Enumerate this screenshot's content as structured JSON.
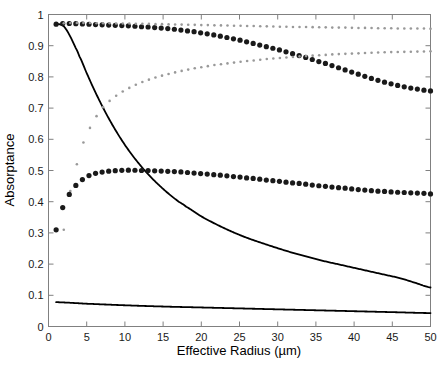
{
  "chart_data": {
    "type": "line",
    "title": "",
    "xlabel": "Effective Radius (µm)",
    "ylabel": "Absorptance",
    "xlim": [
      0,
      50
    ],
    "ylim": [
      0,
      1
    ],
    "xticks": [
      0,
      5,
      10,
      15,
      20,
      25,
      30,
      35,
      40,
      45,
      50
    ],
    "xticklabels": [
      "0",
      "5",
      "10",
      "15",
      "20",
      "25",
      "30",
      "35",
      "40",
      "45",
      "50"
    ],
    "yticks": [
      0,
      0.1,
      0.2,
      0.3,
      0.4,
      0.5,
      0.6,
      0.7,
      0.8,
      0.9,
      1
    ],
    "yticklabels": [
      "0",
      "0.1",
      "0.2",
      "0.3",
      "0.4",
      "0.5",
      "0.6",
      "0.7",
      "0.8",
      "0.9",
      "1"
    ],
    "grid": false,
    "legend": "none",
    "background": "#ffffff",
    "axis_color": "#808080",
    "series": [
      {
        "name": "solid-upper-decreasing",
        "style": "solid",
        "color": "#000000",
        "linewidth": 1.8,
        "x": [
          1,
          1.5,
          2,
          2.5,
          3,
          3.5,
          4,
          5,
          6,
          7,
          8,
          9,
          10,
          11,
          12,
          13,
          14,
          15,
          16,
          17,
          18,
          20,
          22,
          24,
          26,
          28,
          30,
          32,
          34,
          36,
          38,
          40,
          42,
          44,
          46,
          48,
          50
        ],
        "y": [
          0.97,
          0.968,
          0.962,
          0.945,
          0.922,
          0.896,
          0.868,
          0.812,
          0.758,
          0.708,
          0.662,
          0.62,
          0.582,
          0.548,
          0.517,
          0.489,
          0.464,
          0.441,
          0.42,
          0.401,
          0.384,
          0.353,
          0.327,
          0.304,
          0.284,
          0.267,
          0.251,
          0.236,
          0.223,
          0.21,
          0.199,
          0.188,
          0.177,
          0.166,
          0.155,
          0.14,
          0.125
        ]
      },
      {
        "name": "solid-lower-flat",
        "style": "solid",
        "color": "#000000",
        "linewidth": 1.8,
        "x": [
          1,
          5,
          10,
          15,
          20,
          25,
          30,
          35,
          40,
          45,
          50
        ],
        "y": [
          0.078,
          0.073,
          0.068,
          0.064,
          0.061,
          0.058,
          0.055,
          0.052,
          0.049,
          0.046,
          0.043
        ]
      },
      {
        "name": "dotted-bold-top-decreasing",
        "style": "dotted",
        "weight": "bold",
        "color": "#1a1a1a",
        "dotsize": 2.6,
        "x": [
          1,
          2,
          3,
          4,
          5,
          6,
          7,
          8,
          9,
          10,
          11,
          12,
          13,
          14,
          15,
          16,
          17,
          18,
          19,
          20,
          21,
          22,
          23,
          24,
          25,
          26,
          27,
          28,
          29,
          30,
          31,
          32,
          33,
          34,
          35,
          36,
          37,
          38,
          39,
          40,
          41,
          42,
          43,
          44,
          45,
          46,
          47,
          48,
          49,
          50
        ],
        "y": [
          0.969,
          0.971,
          0.971,
          0.97,
          0.969,
          0.968,
          0.967,
          0.966,
          0.965,
          0.964,
          0.963,
          0.961,
          0.96,
          0.958,
          0.956,
          0.954,
          0.951,
          0.948,
          0.945,
          0.941,
          0.937,
          0.933,
          0.928,
          0.923,
          0.918,
          0.912,
          0.906,
          0.9,
          0.894,
          0.888,
          0.881,
          0.874,
          0.867,
          0.86,
          0.852,
          0.845,
          0.837,
          0.829,
          0.821,
          0.813,
          0.805,
          0.797,
          0.79,
          0.783,
          0.777,
          0.771,
          0.766,
          0.762,
          0.758,
          0.755
        ]
      },
      {
        "name": "dotted-light-top-flat",
        "style": "dotted",
        "weight": "light",
        "color": "#999999",
        "dotsize": 1.3,
        "x": [
          2,
          3,
          4,
          5,
          6,
          7,
          8,
          9,
          10,
          11,
          12,
          13,
          14,
          15,
          16,
          17,
          18,
          19,
          20,
          21,
          22,
          23,
          24,
          25,
          26,
          27,
          28,
          29,
          30,
          31,
          32,
          33,
          34,
          35,
          36,
          37,
          38,
          39,
          40,
          41,
          42,
          43,
          44,
          45,
          46,
          47,
          48,
          49,
          50
        ],
        "y": [
          0.972,
          0.973,
          0.973,
          0.973,
          0.972,
          0.972,
          0.972,
          0.971,
          0.971,
          0.971,
          0.97,
          0.97,
          0.969,
          0.969,
          0.968,
          0.968,
          0.967,
          0.967,
          0.966,
          0.966,
          0.965,
          0.965,
          0.964,
          0.964,
          0.963,
          0.963,
          0.962,
          0.962,
          0.961,
          0.961,
          0.96,
          0.96,
          0.96,
          0.959,
          0.959,
          0.958,
          0.958,
          0.958,
          0.957,
          0.957,
          0.957,
          0.956,
          0.956,
          0.956,
          0.955,
          0.955,
          0.955,
          0.955,
          0.954
        ]
      },
      {
        "name": "dotted-light-rising",
        "style": "dotted",
        "weight": "light",
        "color": "#999999",
        "dotsize": 1.3,
        "x": [
          2,
          2.5,
          3,
          3.5,
          4,
          4.5,
          5,
          5.5,
          6,
          6.5,
          7,
          8,
          9,
          10,
          11,
          12,
          13,
          14,
          15,
          16,
          17,
          18,
          19,
          20,
          21,
          22,
          23,
          24,
          25,
          26,
          27,
          28,
          29,
          30,
          31,
          32,
          33,
          34,
          35,
          36,
          37,
          38,
          39,
          40,
          42,
          44,
          46,
          48,
          50
        ],
        "y": [
          0.31,
          0.39,
          0.45,
          0.5,
          0.545,
          0.585,
          0.615,
          0.64,
          0.663,
          0.682,
          0.7,
          0.723,
          0.742,
          0.757,
          0.77,
          0.781,
          0.79,
          0.798,
          0.805,
          0.811,
          0.817,
          0.822,
          0.827,
          0.831,
          0.835,
          0.839,
          0.842,
          0.845,
          0.848,
          0.851,
          0.853,
          0.856,
          0.858,
          0.86,
          0.862,
          0.864,
          0.866,
          0.867,
          0.869,
          0.87,
          0.872,
          0.873,
          0.874,
          0.875,
          0.877,
          0.879,
          0.88,
          0.881,
          0.882
        ]
      },
      {
        "name": "dotted-bold-middle-peaked",
        "style": "dotted",
        "weight": "bold",
        "color": "#1a1a1a",
        "dotsize": 2.6,
        "x": [
          1,
          1.5,
          2,
          2.5,
          3,
          3.5,
          4,
          4.5,
          5,
          5.5,
          6,
          6.5,
          7,
          7.5,
          8,
          9,
          10,
          11,
          12,
          13,
          14,
          15,
          16,
          17,
          18,
          19,
          20,
          21,
          22,
          23,
          24,
          25,
          26,
          27,
          28,
          29,
          30,
          31,
          32,
          33,
          34,
          35,
          36,
          37,
          38,
          39,
          40,
          41,
          42,
          43,
          44,
          45,
          46,
          47,
          48,
          49,
          50
        ],
        "y": [
          0.31,
          0.355,
          0.39,
          0.414,
          0.434,
          0.45,
          0.462,
          0.472,
          0.48,
          0.486,
          0.49,
          0.493,
          0.495,
          0.497,
          0.498,
          0.5,
          0.501,
          0.501,
          0.5,
          0.5,
          0.499,
          0.498,
          0.497,
          0.496,
          0.494,
          0.492,
          0.49,
          0.488,
          0.486,
          0.484,
          0.481,
          0.479,
          0.476,
          0.474,
          0.471,
          0.468,
          0.466,
          0.463,
          0.46,
          0.458,
          0.455,
          0.452,
          0.45,
          0.447,
          0.445,
          0.443,
          0.44,
          0.438,
          0.436,
          0.434,
          0.433,
          0.431,
          0.43,
          0.429,
          0.428,
          0.427,
          0.425
        ]
      }
    ]
  }
}
